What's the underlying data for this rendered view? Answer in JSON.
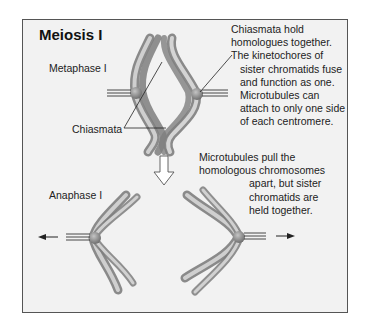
{
  "title": "Meiosis I",
  "stages": {
    "metaphase": {
      "label": "Metaphase I",
      "chiasmata_label": "Chiasmata",
      "note_lines": [
        "Chiasmata hold",
        "homologues together.",
        "The kinetochores of",
        "sister chromatids fuse",
        "and function as one.",
        "Microtubules can",
        "attach to only one side",
        "of each centromere."
      ]
    },
    "anaphase": {
      "label": "Anaphase I",
      "note_lines": [
        "Microtubules pull the",
        "homologous chromosomes",
        "apart, but sister",
        "chromatids are",
        "held together."
      ]
    }
  },
  "icons": {
    "transition": "down-arrow-outline",
    "left_pull": "left-arrow",
    "right_pull": "right-arrow"
  },
  "colors": {
    "frame_bg": "#f2f2f2",
    "frame_border": "#555555",
    "chromosome_light": "#c9c9c9",
    "chromosome_dark": "#8a8a8a",
    "centromere": "#7a7a7a"
  }
}
